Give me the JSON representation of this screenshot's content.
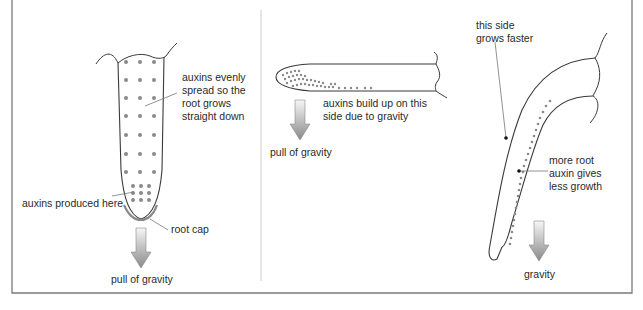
{
  "panels": {
    "left": {
      "label_auxins_spread": "auxins evenly\nspread so the\nroot grows\nstraight down",
      "label_auxins_produced": "auxins produced here",
      "label_root_cap": "root cap",
      "label_gravity": "pull of gravity"
    },
    "middle": {
      "label_build_up": "auxins build up on this\nside due to gravity",
      "label_gravity": "pull of gravity"
    },
    "right": {
      "label_grows_faster": "this side\ngrows faster",
      "label_more_auxin": "more root\nauxin gives\nless growth",
      "label_gravity": "gravity"
    }
  },
  "colors": {
    "outline": "#3a3a3a",
    "auxin_dot": "#8a8a8a",
    "frame": "#7a7a7a",
    "divider": "#c8c8c8",
    "arrow_top": "#f4f4f4",
    "arrow_bottom": "#8c8c8c",
    "leader": "#777777"
  }
}
